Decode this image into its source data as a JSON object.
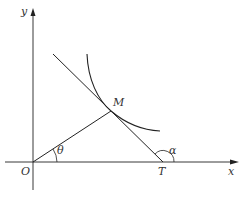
{
  "diagram": {
    "type": "geometry-figure",
    "labels": {
      "y_axis": "y",
      "x_axis": "x",
      "origin": "O",
      "point_m": "M",
      "point_t": "T",
      "angle_theta": "θ",
      "angle_alpha": "α"
    },
    "colors": {
      "stroke": "#222222",
      "text": "#333333",
      "background": "#ffffff"
    }
  }
}
